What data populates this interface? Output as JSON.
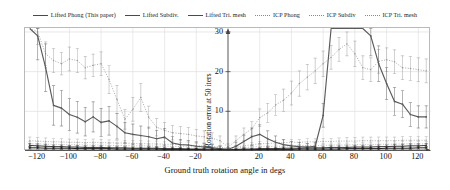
{
  "chart_data": {
    "type": "line",
    "title": "",
    "xlabel": "Ground truth rotation angle in degs",
    "ylabel": "Rotation error at 50 iters",
    "xlim": [
      -128,
      128
    ],
    "ylim": [
      0,
      31
    ],
    "xticks": [
      -120,
      -100,
      -80,
      -60,
      -40,
      -20,
      20,
      40,
      60,
      80,
      100,
      120
    ],
    "yticks": [
      10,
      20,
      30
    ],
    "grid": true,
    "legend_position": "top-center",
    "x": [
      -125,
      -120,
      -115,
      -110,
      -105,
      -100,
      -95,
      -90,
      -85,
      -80,
      -75,
      -70,
      -65,
      -60,
      -55,
      -50,
      -45,
      -40,
      -35,
      -30,
      -25,
      -20,
      -15,
      -10,
      -5,
      0,
      5,
      10,
      15,
      20,
      25,
      30,
      35,
      40,
      45,
      50,
      55,
      60,
      65,
      70,
      75,
      80,
      85,
      90,
      95,
      100,
      105,
      110,
      115,
      120,
      125
    ],
    "series": [
      {
        "name": "Lifted Phong (This paper)",
        "style": "solid",
        "color": "#5a5a5a",
        "values": [
          31,
          29,
          21,
          11.5,
          10.8,
          9.2,
          8.5,
          7.4,
          8.6,
          7.2,
          7.6,
          6.2,
          4.6,
          4.2,
          3.9,
          3.6,
          3.1,
          3.5,
          2.0,
          1.6,
          1.5,
          1.2,
          1.0,
          0.8,
          0.6,
          0.4,
          1.2,
          2.4,
          3.6,
          4.2,
          3.1,
          2.2,
          1.6,
          1.3,
          1.1,
          1.0,
          1.2,
          9.0,
          31,
          31,
          31,
          31,
          31,
          29.0,
          22.0,
          17.0,
          12.5,
          11.8,
          9.2,
          8.6,
          8.6
        ],
        "err": [
          0,
          6,
          6,
          5,
          4.5,
          4,
          4,
          3.6,
          3.8,
          3.5,
          3.6,
          3.2,
          2.6,
          2.6,
          2.4,
          2.4,
          2.1,
          2.2,
          1.6,
          1.3,
          1.2,
          1.1,
          0.9,
          0.8,
          0.6,
          0.4,
          1.0,
          1.6,
          2.2,
          2.4,
          2.0,
          1.6,
          1.3,
          1.1,
          1.0,
          0.9,
          1.0,
          3.0,
          0,
          0,
          0,
          0,
          0,
          5,
          4.5,
          4,
          3.5,
          3.4,
          3.0,
          2.8,
          2.8
        ]
      },
      {
        "name": "Lifted Subdiv.",
        "style": "solid",
        "color": "#3a3a3a",
        "values": [
          1.4,
          1.3,
          1.2,
          1.1,
          1.1,
          1.0,
          1.0,
          0.9,
          0.9,
          0.9,
          0.8,
          0.8,
          0.8,
          0.7,
          0.7,
          0.7,
          0.7,
          0.6,
          0.6,
          0.6,
          0.5,
          0.5,
          0.5,
          0.5,
          0.4,
          0.3,
          0.4,
          0.5,
          0.5,
          0.6,
          0.6,
          0.6,
          0.7,
          0.7,
          0.7,
          0.8,
          0.8,
          0.8,
          0.9,
          0.9,
          0.9,
          1.0,
          1.0,
          1.0,
          1.1,
          1.1,
          1.2,
          1.2,
          1.3,
          1.3,
          1.4
        ],
        "err": [
          0.5,
          0.5,
          0.5,
          0.4,
          0.4,
          0.4,
          0.4,
          0.4,
          0.4,
          0.4,
          0.3,
          0.3,
          0.3,
          0.3,
          0.3,
          0.3,
          0.3,
          0.3,
          0.3,
          0.3,
          0.2,
          0.2,
          0.2,
          0.2,
          0.2,
          0.2,
          0.2,
          0.2,
          0.2,
          0.3,
          0.3,
          0.3,
          0.3,
          0.3,
          0.3,
          0.3,
          0.3,
          0.3,
          0.4,
          0.4,
          0.4,
          0.4,
          0.4,
          0.4,
          0.4,
          0.4,
          0.5,
          0.5,
          0.5,
          0.5,
          0.5
        ]
      },
      {
        "name": "Lifted Tri. mesh",
        "style": "solid",
        "color": "#1e1e1e",
        "values": [
          0.8,
          0.8,
          0.7,
          0.7,
          0.7,
          0.7,
          0.6,
          0.6,
          0.6,
          0.6,
          0.6,
          0.5,
          0.5,
          0.5,
          0.5,
          0.5,
          0.5,
          0.4,
          0.4,
          0.4,
          0.4,
          0.4,
          0.3,
          0.3,
          0.3,
          0.2,
          0.3,
          0.3,
          0.3,
          0.4,
          0.4,
          0.4,
          0.4,
          0.4,
          0.5,
          0.5,
          0.5,
          0.5,
          0.5,
          0.5,
          0.6,
          0.6,
          0.6,
          0.6,
          0.6,
          0.7,
          0.7,
          0.7,
          0.7,
          0.8,
          0.8
        ],
        "err": [
          0.3,
          0.3,
          0.3,
          0.3,
          0.3,
          0.3,
          0.3,
          0.2,
          0.2,
          0.2,
          0.2,
          0.2,
          0.2,
          0.2,
          0.2,
          0.2,
          0.2,
          0.2,
          0.2,
          0.2,
          0.2,
          0.2,
          0.2,
          0.2,
          0.1,
          0.1,
          0.1,
          0.2,
          0.2,
          0.2,
          0.2,
          0.2,
          0.2,
          0.2,
          0.2,
          0.2,
          0.2,
          0.2,
          0.2,
          0.2,
          0.3,
          0.3,
          0.3,
          0.3,
          0.3,
          0.3,
          0.3,
          0.3,
          0.3,
          0.3,
          0.3
        ]
      },
      {
        "name": "ICP Phong",
        "style": "dotted",
        "color": "#9a9a9a",
        "values": [
          31,
          30,
          24.5,
          22.8,
          22.0,
          23.2,
          22.8,
          21.0,
          21.6,
          22.0,
          18.0,
          13.0,
          8.0,
          10.5,
          13.5,
          8.5,
          6.0,
          5.2,
          4.6,
          4.4,
          4.2,
          3.8,
          3.6,
          3.2,
          2.6,
          1.0,
          2.6,
          4.2,
          5.6,
          8.4,
          9.6,
          11.6,
          12.8,
          14.6,
          17.0,
          18.6,
          20.2,
          22.0,
          23.6,
          25.6,
          27.0,
          24.5,
          21.0,
          20.5,
          22.6,
          23.0,
          22.5,
          21.0,
          20.8,
          20.5,
          20.2
        ],
        "err": [
          0,
          3.2,
          3.0,
          3.0,
          2.8,
          3.0,
          3.0,
          2.8,
          2.8,
          3.0,
          3.5,
          3.5,
          2.5,
          3.0,
          3.5,
          2.8,
          2.2,
          2.0,
          1.8,
          1.8,
          1.7,
          1.6,
          1.5,
          1.4,
          1.2,
          0.8,
          1.2,
          1.6,
          1.8,
          2.2,
          2.4,
          2.6,
          2.8,
          3.0,
          3.2,
          3.2,
          3.2,
          3.2,
          3.0,
          3.0,
          3.0,
          3.2,
          3.0,
          3.0,
          3.0,
          3.0,
          3.0,
          3.0,
          3.0,
          3.0,
          3.0
        ]
      },
      {
        "name": "ICP Subdiv",
        "style": "dotted",
        "color": "#a8a8a8",
        "values": [
          2.6,
          2.5,
          2.4,
          2.3,
          2.3,
          2.2,
          2.2,
          2.1,
          2.2,
          2.1,
          2.1,
          2.0,
          2.0,
          1.9,
          1.9,
          1.8,
          1.8,
          1.7,
          1.7,
          1.6,
          1.5,
          1.4,
          1.3,
          1.2,
          1.0,
          0.6,
          1.0,
          1.3,
          1.6,
          1.8,
          1.9,
          2.0,
          2.1,
          2.2,
          2.2,
          2.3,
          2.3,
          2.4,
          2.4,
          2.5,
          2.5,
          2.5,
          2.6,
          2.6,
          2.6,
          2.6,
          2.6,
          2.7,
          2.7,
          2.7,
          2.7
        ],
        "err": [
          0.9,
          0.9,
          0.9,
          0.8,
          0.8,
          0.8,
          0.8,
          0.8,
          0.8,
          0.8,
          0.7,
          0.7,
          0.7,
          0.7,
          0.7,
          0.7,
          0.7,
          0.6,
          0.6,
          0.6,
          0.6,
          0.5,
          0.5,
          0.5,
          0.4,
          0.3,
          0.4,
          0.5,
          0.5,
          0.6,
          0.6,
          0.7,
          0.7,
          0.7,
          0.7,
          0.8,
          0.8,
          0.8,
          0.8,
          0.8,
          0.9,
          0.9,
          0.9,
          0.9,
          0.9,
          0.9,
          0.9,
          1.0,
          1.0,
          1.0,
          1.0
        ]
      },
      {
        "name": "ICP Tri. mesh",
        "style": "dotted",
        "color": "#b2b2b2",
        "values": [
          1.8,
          1.8,
          1.7,
          1.7,
          1.6,
          1.6,
          1.6,
          1.5,
          1.5,
          1.5,
          1.4,
          1.4,
          1.4,
          1.3,
          1.3,
          1.3,
          1.2,
          1.2,
          1.2,
          1.1,
          1.1,
          1.0,
          1.0,
          0.9,
          0.8,
          0.5,
          0.8,
          0.9,
          1.0,
          1.1,
          1.1,
          1.2,
          1.2,
          1.3,
          1.3,
          1.4,
          1.4,
          1.4,
          1.5,
          1.5,
          1.5,
          1.6,
          1.6,
          1.6,
          1.7,
          1.7,
          1.7,
          1.8,
          1.8,
          1.8,
          1.8
        ],
        "err": [
          0.6,
          0.6,
          0.6,
          0.6,
          0.6,
          0.5,
          0.5,
          0.5,
          0.5,
          0.5,
          0.5,
          0.5,
          0.5,
          0.5,
          0.4,
          0.4,
          0.4,
          0.4,
          0.4,
          0.4,
          0.4,
          0.4,
          0.3,
          0.3,
          0.3,
          0.2,
          0.3,
          0.3,
          0.3,
          0.4,
          0.4,
          0.4,
          0.4,
          0.4,
          0.4,
          0.5,
          0.5,
          0.5,
          0.5,
          0.5,
          0.5,
          0.5,
          0.5,
          0.6,
          0.6,
          0.6,
          0.6,
          0.6,
          0.6,
          0.6,
          0.6
        ]
      }
    ]
  },
  "legend": {
    "items": [
      {
        "label": "Lifted Phong (This paper)",
        "style": "solid"
      },
      {
        "label": "Lifted Subdiv.",
        "style": "solid"
      },
      {
        "label": "Lifted Tri. mesh",
        "style": "solid"
      },
      {
        "label": "ICP Phong",
        "style": "dotted"
      },
      {
        "label": "ICP Subdiv",
        "style": "dotted"
      },
      {
        "label": "ICP Tri. mesh",
        "style": "dotted"
      }
    ]
  },
  "axes": {
    "xlabel": "Ground truth rotation angle in degs",
    "ylabel": "Rotation error at 50 iters",
    "xtick_labels": [
      "−120",
      "−100",
      "−80",
      "−60",
      "−40",
      "−20",
      "20",
      "40",
      "60",
      "80",
      "100",
      "120"
    ],
    "ytick_labels": [
      "10",
      "20",
      "30"
    ]
  }
}
